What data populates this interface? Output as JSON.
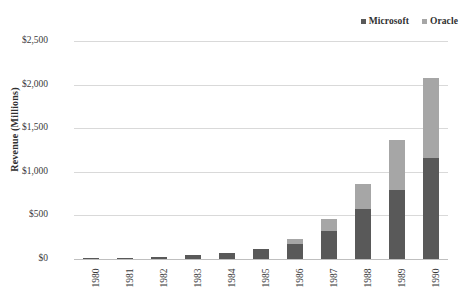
{
  "legend": {
    "items": [
      {
        "label": "Microsoft",
        "color": "#595959",
        "icon": "square-marker-icon"
      },
      {
        "label": "Oracle",
        "color": "#a6a6a6",
        "icon": "square-marker-icon"
      }
    ]
  },
  "axis": {
    "y_title": "Revenue (Millions)",
    "y_ticks": [
      "$2,500",
      "$2,000",
      "$1,500",
      "$1,000",
      "$500",
      "$0"
    ]
  },
  "chart_data": {
    "type": "bar",
    "subtype": "stacked-vertical",
    "title": "",
    "subtitle": "",
    "xlabel": "",
    "ylabel": "Revenue (Millions)",
    "ylim": [
      0,
      2500
    ],
    "ytick_values": [
      0,
      500,
      1000,
      1500,
      2000,
      2500
    ],
    "ytick_labels": [
      "$0",
      "$500",
      "$1,000",
      "$1,500",
      "$2,000",
      "$2,500"
    ],
    "grid": true,
    "legend_position": "top-right",
    "categories": [
      "1980",
      "1981",
      "1982",
      "1983",
      "1984",
      "1985",
      "1986",
      "1987",
      "1988",
      "1989",
      "1990"
    ],
    "series": [
      {
        "name": "Microsoft",
        "color": "#595959",
        "values": [
          8,
          16,
          24,
          50,
          70,
          115,
          172,
          321,
          574,
          790,
          1158
        ]
      },
      {
        "name": "Oracle",
        "color": "#a6a6a6",
        "values": [
          0,
          0,
          0,
          0,
          0,
          0,
          57,
          138,
          286,
          575,
          918
        ]
      }
    ],
    "totals": [
      8,
      16,
      24,
      50,
      70,
      115,
      229,
      459,
      860,
      1365,
      2076
    ]
  }
}
